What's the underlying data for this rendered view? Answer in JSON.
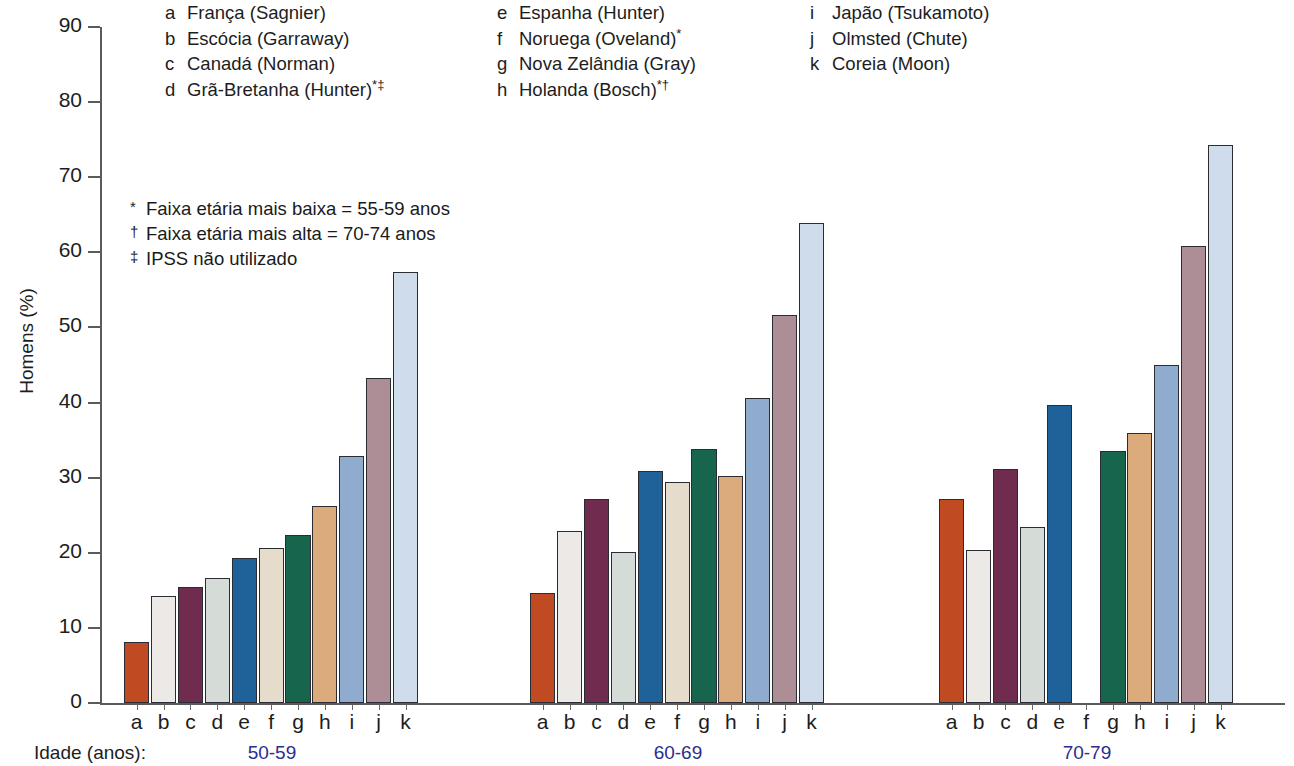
{
  "legend": {
    "columns": [
      [
        {
          "key": "a",
          "label": "França (Sagnier)",
          "marks": ""
        },
        {
          "key": "b",
          "label": "Escócia (Garraway)",
          "marks": ""
        },
        {
          "key": "c",
          "label": "Canadá (Norman)",
          "marks": ""
        },
        {
          "key": "d",
          "label": "Grã-Bretanha (Hunter)",
          "marks": "*‡"
        }
      ],
      [
        {
          "key": "e",
          "label": "Espanha (Hunter)",
          "marks": ""
        },
        {
          "key": "f",
          "label": "Noruega (Oveland)",
          "marks": "*"
        },
        {
          "key": "g",
          "label": "Nova Zelândia (Gray)",
          "marks": ""
        },
        {
          "key": "h",
          "label": "Holanda (Bosch)",
          "marks": "*†"
        }
      ],
      [
        {
          "key": "i",
          "label": "Japão (Tsukamoto)",
          "marks": ""
        },
        {
          "key": "j",
          "label": "Olmsted (Chute)",
          "marks": ""
        },
        {
          "key": "k",
          "label": "Coreia (Moon)",
          "marks": ""
        }
      ]
    ]
  },
  "footnotes": [
    {
      "mark": "*",
      "text": "Faixa etária mais baixa = 55-59 anos"
    },
    {
      "mark": "†",
      "text": "Faixa etária mais alta = 70-74 anos"
    },
    {
      "mark": "‡",
      "text": "IPSS não utilizado"
    }
  ],
  "axis": {
    "idade_label": "Idade (anos):",
    "group_label_color": "#2b2e8c"
  },
  "chart_data": {
    "type": "bar",
    "title": "",
    "xlabel": "Idade (anos)",
    "ylabel": "Homens (%)",
    "ylim": [
      0,
      90
    ],
    "yticks": [
      0,
      10,
      20,
      30,
      40,
      50,
      60,
      70,
      80,
      90
    ],
    "ytick_labels": [
      "0",
      "10",
      "20",
      "30",
      "40",
      "50",
      "60",
      "70",
      "80",
      "90"
    ],
    "grid": false,
    "legend_position": "top",
    "categories": [
      "50-59",
      "60-69",
      "70-79"
    ],
    "series_keys": [
      "a",
      "b",
      "c",
      "d",
      "e",
      "f",
      "g",
      "h",
      "i",
      "j",
      "k"
    ],
    "series": [
      {
        "name": "a",
        "label": "França (Sagnier)",
        "color": "#c04a22",
        "values": [
          8.1,
          14.6,
          27.2
        ]
      },
      {
        "name": "b",
        "label": "Escócia (Garraway)",
        "color": "#ece9e6",
        "values": [
          14.3,
          22.9,
          20.4
        ]
      },
      {
        "name": "c",
        "label": "Canadá (Norman)",
        "color": "#6f2c4e",
        "values": [
          15.4,
          27.1,
          31.1
        ]
      },
      {
        "name": "d",
        "label": "Grã-Bretanha (Hunter)",
        "color": "#d5dcd8",
        "values": [
          16.6,
          20.1,
          23.4
        ]
      },
      {
        "name": "e",
        "label": "Espanha (Hunter)",
        "color": "#1f6299",
        "values": [
          19.3,
          30.9,
          39.7
        ]
      },
      {
        "name": "f",
        "label": "Noruega (Oveland)",
        "color": "#e6dccb",
        "values": [
          20.7,
          29.4,
          null
        ]
      },
      {
        "name": "g",
        "label": "Nova Zelândia (Gray)",
        "color": "#16654c",
        "values": [
          22.4,
          33.8,
          33.5
        ]
      },
      {
        "name": "h",
        "label": "Holanda (Bosch)",
        "color": "#dbab7c",
        "values": [
          26.2,
          30.2,
          36.0
        ]
      },
      {
        "name": "i",
        "label": "Japão (Tsukamoto)",
        "color": "#8fabcd",
        "values": [
          32.9,
          40.6,
          45.0
        ]
      },
      {
        "name": "j",
        "label": "Olmsted (Chute)",
        "color": "#ad8e96",
        "values": [
          43.3,
          51.6,
          60.9
        ]
      },
      {
        "name": "k",
        "label": "Coreia (Moon)",
        "color": "#cfdceb",
        "values": [
          57.4,
          63.9,
          74.3
        ]
      }
    ]
  }
}
